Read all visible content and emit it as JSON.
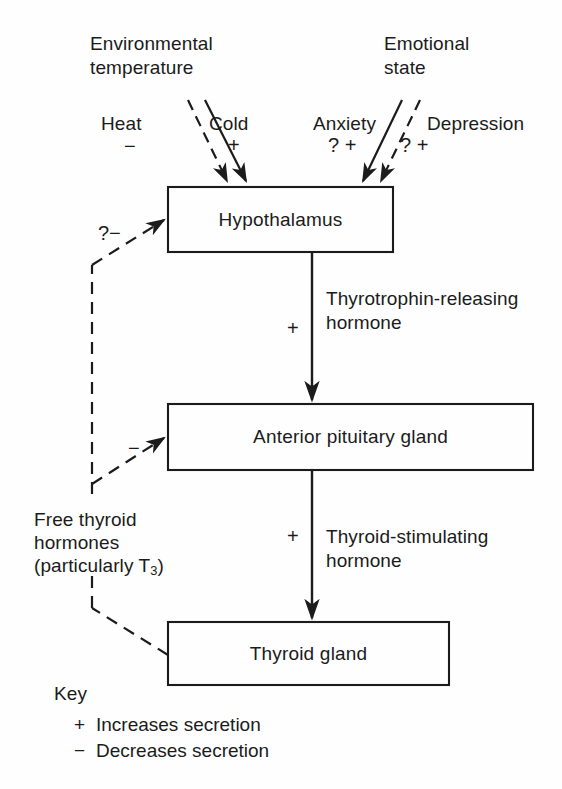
{
  "diagram": {
    "stroke_color": "#1b1b1b",
    "background_color": "#fefefe",
    "boxes": [
      {
        "id": "hypothalamus",
        "label": "Hypothalamus"
      },
      {
        "id": "anterior-pituitary",
        "label": "Anterior pituitary gland"
      },
      {
        "id": "thyroid",
        "label": "Thyroid gland"
      }
    ],
    "inputs": {
      "environmental": {
        "heading_line1": "Environmental",
        "heading_line2": "temperature",
        "left_label": "Heat",
        "left_sign": "−",
        "right_label": "Cold",
        "right_sign": "+"
      },
      "emotional": {
        "heading_line1": "Emotional",
        "heading_line2": "state",
        "left_label": "Anxiety",
        "left_sign": "? +",
        "right_label": "Depression",
        "right_sign": "? +"
      }
    },
    "hormones": {
      "trh_line1": "Thyrotrophin-releasing",
      "trh_line2": "hormone",
      "trh_sign": "+",
      "tsh_line1": "Thyroid-stimulating",
      "tsh_line2": "hormone",
      "tsh_sign": "+"
    },
    "feedback": {
      "line1": "Free thyroid",
      "line2": "hormones",
      "line3_pre": "(particularly T",
      "line3_sub": "3",
      "line3_post": ")",
      "to_hypothalamus_sign": "?−",
      "to_pituitary_sign": "−"
    },
    "key": {
      "title": "Key",
      "entries": [
        {
          "symbol": "+",
          "text": "Increases secretion"
        },
        {
          "symbol": "−",
          "text": "Decreases secretion"
        }
      ]
    }
  }
}
